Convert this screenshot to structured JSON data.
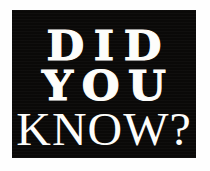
{
  "graphic": {
    "type": "did-you-know-banner",
    "background_color": "#ffffff",
    "plaque_color": "#0a0908",
    "text_color": "#fdfdfb",
    "lines": [
      {
        "text": "DID",
        "weight": "heavy-serif",
        "case": "uppercase"
      },
      {
        "text": "YOU",
        "weight": "heavy-serif",
        "case": "uppercase"
      },
      {
        "text": "KNOW?",
        "weight": "normal-serif",
        "case": "uppercase"
      }
    ],
    "full_text": "DID YOU KNOW?"
  }
}
